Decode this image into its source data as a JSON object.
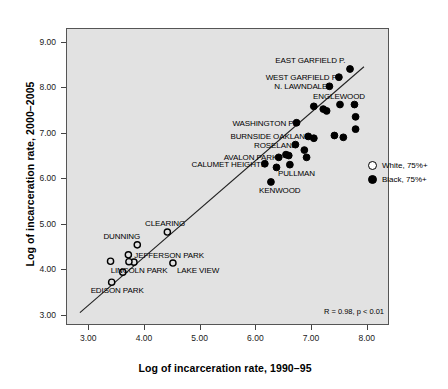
{
  "chart_data": {
    "type": "scatter",
    "title": "",
    "xlabel": "Log of incarceration rate, 1990–95",
    "ylabel": "Log of incarceration rate, 2000–2005",
    "xlim": [
      2.6,
      8.4
    ],
    "ylim": [
      2.78,
      9.3
    ],
    "xticks": [
      "3.00",
      "4.00",
      "5.00",
      "6.00",
      "7.00",
      "8.00"
    ],
    "xtick_values": [
      3,
      4,
      5,
      6,
      7,
      8
    ],
    "yticks": [
      "3.00",
      "4.00",
      "5.00",
      "6.00",
      "7.00",
      "8.00",
      "9.00"
    ],
    "ytick_values": [
      3,
      4,
      5,
      6,
      7,
      8,
      9
    ],
    "grid": false,
    "annotation": "R = 0.98, p < 0.01",
    "legend_position": "right-middle",
    "legend": [
      {
        "marker": "open-circle",
        "label": "White, 75%+"
      },
      {
        "marker": "filled-circle",
        "label": "Black, 75%+"
      }
    ],
    "trendline": {
      "x": [
        2.85,
        7.95
      ],
      "y": [
        3.05,
        8.45
      ]
    },
    "series": [
      {
        "name": "White, 75%+",
        "marker": "open-circle",
        "points": [
          {
            "label": "CLEARING",
            "x": 4.42,
            "y": 4.82,
            "label_pos": "above-right"
          },
          {
            "label": "DUNNING",
            "x": 3.88,
            "y": 4.54,
            "label_pos": "above-left"
          },
          {
            "label": "JEFFERSON PARK",
            "x": 3.72,
            "y": 4.32,
            "label_pos": "right"
          },
          {
            "label": "LINCOLN PARK",
            "x": 3.82,
            "y": 4.16,
            "label_pos": "below"
          },
          {
            "label": "LAKE VIEW",
            "x": 4.52,
            "y": 4.14,
            "label_pos": "below-right"
          },
          {
            "label": "EDISON PARK",
            "x": 3.42,
            "y": 3.72,
            "label_pos": "below"
          },
          {
            "label": "",
            "x": 3.4,
            "y": 4.18,
            "label_pos": "none"
          },
          {
            "label": "",
            "x": 3.73,
            "y": 4.17,
            "label_pos": "none"
          },
          {
            "label": "",
            "x": 3.62,
            "y": 3.94,
            "label_pos": "none"
          }
        ]
      },
      {
        "name": "Black, 75%+",
        "marker": "filled-circle",
        "points": [
          {
            "label": "EAST GARFIELD P.",
            "x": 7.7,
            "y": 8.4,
            "label_pos": "above-left"
          },
          {
            "label": "WEST GARFIELD P",
            "x": 7.5,
            "y": 8.22,
            "label_pos": "left"
          },
          {
            "label": "N. LAWNDALE",
            "x": 7.33,
            "y": 8.02,
            "label_pos": "left"
          },
          {
            "label": "ENGLEWOOD",
            "x": 7.52,
            "y": 7.62,
            "label_pos": "above-right"
          },
          {
            "label": "WASHINGTON P.",
            "x": 6.74,
            "y": 7.22,
            "label_pos": "left"
          },
          {
            "label": "BURNSIDE OAKLAND",
            "x": 6.95,
            "y": 6.92,
            "label_pos": "left"
          },
          {
            "label": "ROSELAND",
            "x": 6.72,
            "y": 6.74,
            "label_pos": "left"
          },
          {
            "label": "AVALON PARK",
            "x": 6.42,
            "y": 6.46,
            "label_pos": "left"
          },
          {
            "label": "CALUMET HEIGHTS",
            "x": 6.17,
            "y": 6.32,
            "label_pos": "left"
          },
          {
            "label": "PULLMAN",
            "x": 6.62,
            "y": 6.3,
            "label_pos": "below"
          },
          {
            "label": "KENWOOD",
            "x": 6.28,
            "y": 5.92,
            "label_pos": "below"
          },
          {
            "label": "",
            "x": 7.05,
            "y": 7.58,
            "label_pos": "none"
          },
          {
            "label": "",
            "x": 7.22,
            "y": 7.52,
            "label_pos": "none"
          },
          {
            "label": "",
            "x": 7.28,
            "y": 7.48,
            "label_pos": "none"
          },
          {
            "label": "",
            "x": 7.78,
            "y": 7.62,
            "label_pos": "none"
          },
          {
            "label": "",
            "x": 7.8,
            "y": 7.35,
            "label_pos": "none"
          },
          {
            "label": "",
            "x": 7.8,
            "y": 7.08,
            "label_pos": "none"
          },
          {
            "label": "",
            "x": 7.42,
            "y": 6.94,
            "label_pos": "none"
          },
          {
            "label": "",
            "x": 7.58,
            "y": 6.9,
            "label_pos": "none"
          },
          {
            "label": "",
            "x": 7.05,
            "y": 6.88,
            "label_pos": "none"
          },
          {
            "label": "",
            "x": 6.88,
            "y": 6.62,
            "label_pos": "none"
          },
          {
            "label": "",
            "x": 6.92,
            "y": 6.46,
            "label_pos": "none"
          },
          {
            "label": "",
            "x": 6.55,
            "y": 6.52,
            "label_pos": "none"
          },
          {
            "label": "",
            "x": 6.6,
            "y": 6.5,
            "label_pos": "none"
          },
          {
            "label": "",
            "x": 6.38,
            "y": 6.24,
            "label_pos": "none"
          }
        ]
      }
    ]
  }
}
